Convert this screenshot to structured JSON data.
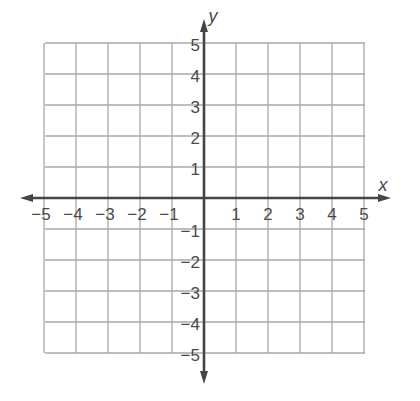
{
  "chart_data": {
    "type": "scatter",
    "title": "",
    "subtitle": "",
    "xlabel": "x",
    "ylabel": "y",
    "xlim": [
      -5,
      5
    ],
    "ylim": [
      -5,
      5
    ],
    "grid": true,
    "legend": null,
    "x_ticks": [
      -5,
      -4,
      -3,
      -2,
      -1,
      1,
      2,
      3,
      4,
      5
    ],
    "y_ticks": [
      5,
      4,
      3,
      2,
      1,
      -1,
      -2,
      -3,
      -4,
      -5
    ],
    "x_tick_labels": [
      "−5",
      "−4",
      "−3",
      "−2",
      "−1",
      "1",
      "2",
      "3",
      "4",
      "5"
    ],
    "y_tick_labels": [
      "5",
      "4",
      "3",
      "2",
      "1",
      "−1",
      "−2",
      "−3",
      "−4",
      "−5"
    ],
    "series": [],
    "annotations": []
  },
  "colors": {
    "background": "#ffffff",
    "grid": "#a8a8a8",
    "axis": "#454545",
    "label": "#4a4a4a"
  },
  "layout": {
    "origin_px": [
      204,
      198
    ],
    "unit_px": [
      32,
      31
    ],
    "grid_left": 45,
    "grid_top": 43,
    "grid_right": 365,
    "grid_bottom": 353,
    "x_axis_ends": [
      20,
      391
    ],
    "y_axis_ends": [
      19,
      384
    ]
  }
}
